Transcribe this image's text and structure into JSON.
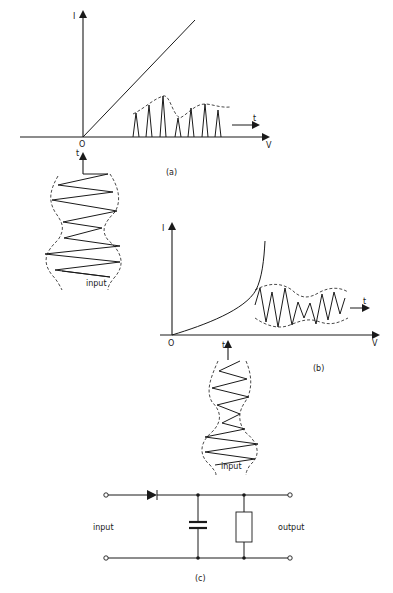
{
  "figure": {
    "panel_a": {
      "caption": "(a)",
      "y_axis_label": "I",
      "x_axis_label": "V",
      "origin_label": "O",
      "time_label_output": "t",
      "time_label_input": "t",
      "input_label": "input",
      "characteristic": "linear (ideal rectifier, conducts for V > 0)",
      "output_description": "half-wave rectified pulses following the envelope"
    },
    "panel_b": {
      "caption": "(b)",
      "y_axis_label": "I",
      "x_axis_label": "V",
      "origin_label": "O",
      "time_label_output": "t",
      "time_label_input": "t",
      "input_label": "input",
      "characteristic": "exponential / square-law (non-linear diode)",
      "output_description": "distorted modulated wave with envelope"
    },
    "panel_c": {
      "caption": "(c)",
      "input_label": "input",
      "output_label": "output",
      "components": [
        "diode",
        "capacitor",
        "resistor"
      ],
      "description": "envelope detector: series diode, shunt capacitor and load resistor"
    }
  },
  "colors": {
    "ink": "#1a1a1a",
    "background": "#ffffff"
  }
}
